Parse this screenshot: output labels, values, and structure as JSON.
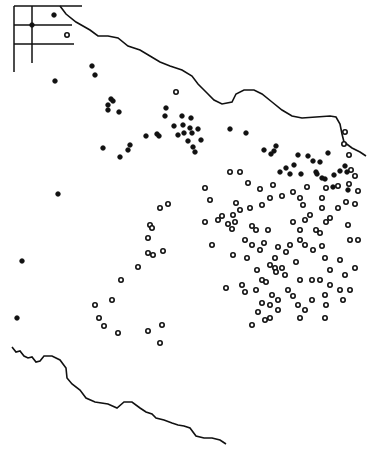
{
  "figure": {
    "type": "dot distribution map",
    "colors": {
      "ink": "#111111",
      "background": "#ffffff"
    },
    "legend": {
      "visible": false
    },
    "inset": {
      "lines": "grid inset at top-left",
      "dots": [
        [
          54,
          14
        ],
        [
          32,
          24
        ],
        [
          67,
          35
        ]
      ]
    },
    "boundaries": {
      "north": "M20,8 L40,32 L52,38 L62,35 L72,45 L84,53 L100,62 L115,75 L125,80 L138,90 L145,98 L152,103 L160,105 L166,98 L175,92 L185,90 L195,95 L205,105 L215,113 L230,118 L242,117 L255,117 L262,118 L265,128 L268,138 L275,143 L290,150",
      "north_right": "M300,115 L315,120 L340,125 L345,130 L348,145 L355,152 L365,160",
      "south": "M12,347 L16,352 L22,355 L28,358 L34,360 L40,364 L46,360 L55,358 L62,361 L66,372 L72,380 L80,388 L86,395 L95,400 L108,404 L117,407 L125,402 L133,404 L145,410 L152,415 L158,418 L165,420 L172,423 L180,426 L185,430 L196,433 L210,433 L222,435 L228,438"
    },
    "dots_solid": [
      [
        92,
        66
      ],
      [
        95,
        75
      ],
      [
        111,
        99
      ],
      [
        113,
        101
      ],
      [
        108,
        110
      ],
      [
        119,
        112
      ],
      [
        108,
        105
      ],
      [
        166,
        108
      ],
      [
        165,
        116
      ],
      [
        182,
        116
      ],
      [
        183,
        125
      ],
      [
        190,
        128
      ],
      [
        191,
        118
      ],
      [
        184,
        133
      ],
      [
        192,
        133
      ],
      [
        146,
        136
      ],
      [
        157,
        134
      ],
      [
        159,
        136
      ],
      [
        174,
        126
      ],
      [
        198,
        129
      ],
      [
        188,
        141
      ],
      [
        193,
        147
      ],
      [
        195,
        152
      ],
      [
        178,
        135
      ],
      [
        201,
        140
      ],
      [
        130,
        145
      ],
      [
        103,
        148
      ],
      [
        128,
        150
      ],
      [
        120,
        157
      ],
      [
        230,
        129
      ],
      [
        246,
        133
      ],
      [
        276,
        146
      ],
      [
        264,
        150
      ],
      [
        271,
        154
      ],
      [
        274,
        151
      ],
      [
        298,
        155
      ],
      [
        308,
        156
      ],
      [
        294,
        165
      ],
      [
        280,
        172
      ],
      [
        316,
        172
      ],
      [
        286,
        168
      ],
      [
        290,
        174
      ],
      [
        301,
        174
      ],
      [
        317,
        174
      ],
      [
        328,
        153
      ],
      [
        313,
        161
      ],
      [
        320,
        162
      ],
      [
        345,
        166
      ],
      [
        322,
        178
      ],
      [
        325,
        179
      ],
      [
        333,
        187
      ],
      [
        348,
        190
      ],
      [
        340,
        171
      ],
      [
        334,
        175
      ],
      [
        347,
        172
      ],
      [
        55,
        81
      ],
      [
        58,
        194
      ],
      [
        22,
        261
      ],
      [
        17,
        318
      ]
    ],
    "dots_open": [
      [
        345,
        132
      ],
      [
        344,
        144
      ],
      [
        349,
        155
      ],
      [
        351,
        170
      ],
      [
        355,
        176
      ],
      [
        349,
        184
      ],
      [
        358,
        191
      ],
      [
        338,
        186
      ],
      [
        326,
        188
      ],
      [
        307,
        187
      ],
      [
        293,
        192
      ],
      [
        322,
        198
      ],
      [
        300,
        198
      ],
      [
        322,
        208
      ],
      [
        338,
        208
      ],
      [
        355,
        204
      ],
      [
        348,
        225
      ],
      [
        330,
        218
      ],
      [
        320,
        233
      ],
      [
        316,
        230
      ],
      [
        300,
        230
      ],
      [
        293,
        222
      ],
      [
        305,
        220
      ],
      [
        300,
        240
      ],
      [
        290,
        245
      ],
      [
        286,
        252
      ],
      [
        278,
        247
      ],
      [
        275,
        258
      ],
      [
        275,
        268
      ],
      [
        282,
        268
      ],
      [
        305,
        245
      ],
      [
        313,
        250
      ],
      [
        322,
        246
      ],
      [
        325,
        258
      ],
      [
        330,
        270
      ],
      [
        340,
        260
      ],
      [
        345,
        275
      ],
      [
        355,
        268
      ],
      [
        340,
        290
      ],
      [
        350,
        290
      ],
      [
        343,
        300
      ],
      [
        325,
        295
      ],
      [
        326,
        305
      ],
      [
        312,
        300
      ],
      [
        305,
        310
      ],
      [
        298,
        305
      ],
      [
        300,
        280
      ],
      [
        312,
        280
      ],
      [
        320,
        280
      ],
      [
        330,
        285
      ],
      [
        288,
        290
      ],
      [
        293,
        296
      ],
      [
        278,
        300
      ],
      [
        270,
        305
      ],
      [
        262,
        303
      ],
      [
        258,
        312
      ],
      [
        256,
        290
      ],
      [
        262,
        280
      ],
      [
        247,
        258
      ],
      [
        242,
        285
      ],
      [
        245,
        292
      ],
      [
        233,
        255
      ],
      [
        252,
        245
      ],
      [
        260,
        250
      ],
      [
        264,
        243
      ],
      [
        268,
        230
      ],
      [
        256,
        230
      ],
      [
        245,
        240
      ],
      [
        226,
        288
      ],
      [
        228,
        224
      ],
      [
        235,
        222
      ],
      [
        232,
        229
      ],
      [
        252,
        226
      ],
      [
        233,
        215
      ],
      [
        257,
        270
      ],
      [
        266,
        282
      ],
      [
        270,
        265
      ],
      [
        276,
        272
      ],
      [
        285,
        275
      ],
      [
        296,
        262
      ],
      [
        272,
        295
      ],
      [
        278,
        310
      ],
      [
        270,
        318
      ],
      [
        265,
        320
      ],
      [
        252,
        325
      ],
      [
        300,
        318
      ],
      [
        325,
        318
      ],
      [
        210,
        200
      ],
      [
        218,
        220
      ],
      [
        205,
        222
      ],
      [
        212,
        245
      ],
      [
        205,
        188
      ],
      [
        222,
        216
      ],
      [
        236,
        203
      ],
      [
        240,
        210
      ],
      [
        250,
        208
      ],
      [
        262,
        205
      ],
      [
        270,
        198
      ],
      [
        282,
        196
      ],
      [
        303,
        205
      ],
      [
        310,
        215
      ],
      [
        326,
        222
      ],
      [
        350,
        240
      ],
      [
        358,
        240
      ],
      [
        346,
        202
      ],
      [
        240,
        172
      ],
      [
        230,
        172
      ],
      [
        260,
        189
      ],
      [
        273,
        185
      ],
      [
        248,
        183
      ],
      [
        150,
        225
      ],
      [
        163,
        251
      ],
      [
        153,
        255
      ],
      [
        148,
        238
      ],
      [
        138,
        267
      ],
      [
        121,
        280
      ],
      [
        112,
        300
      ],
      [
        95,
        305
      ],
      [
        99,
        318
      ],
      [
        104,
        326
      ],
      [
        118,
        333
      ],
      [
        148,
        331
      ],
      [
        160,
        343
      ],
      [
        162,
        325
      ],
      [
        152,
        228
      ],
      [
        168,
        204
      ],
      [
        148,
        253
      ],
      [
        160,
        208
      ],
      [
        176,
        92
      ]
    ],
    "caption": ""
  }
}
